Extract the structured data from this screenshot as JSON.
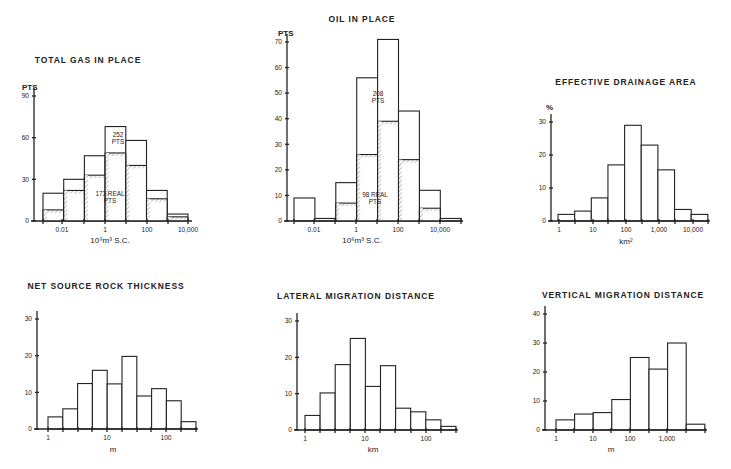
{
  "chart_data": [
    {
      "id": "gas",
      "type": "bar",
      "title": "TOTAL GAS IN PLACE",
      "ylabel": "PTS",
      "xlabel": "10⁹m³ S.C.",
      "yticks": [
        0,
        30,
        60,
        90
      ],
      "ylim": [
        0,
        90
      ],
      "xticks": [
        "0.01",
        "1",
        "100",
        "10,000"
      ],
      "x_scale": "log",
      "bin_edges_log10": [
        -3,
        -2.5,
        -1.5,
        -0.5,
        0.5,
        1.5,
        2.5,
        4
      ],
      "series": [
        {
          "name": "252 PTS (total)",
          "values": [
            20,
            30,
            47,
            68,
            58,
            22,
            5
          ]
        },
        {
          "name": "173 REAL PTS",
          "values": [
            8,
            22,
            33,
            49,
            40,
            16,
            3
          ],
          "style": "hatched"
        }
      ],
      "annotations": [
        {
          "text": [
            "252",
            "PTS"
          ]
        },
        {
          "text": [
            "173 REAL",
            "PTS"
          ]
        }
      ]
    },
    {
      "id": "oil",
      "type": "bar",
      "title": "OIL IN PLACE",
      "ylabel": "PTS",
      "xlabel": "10⁶m³ S.C.",
      "yticks": [
        0,
        10,
        20,
        30,
        40,
        50,
        60,
        70
      ],
      "ylim": [
        0,
        70
      ],
      "xticks": [
        "0.01",
        "1",
        "100",
        "10,000"
      ],
      "x_scale": "log",
      "series": [
        {
          "name": "208 PTS (total)",
          "values": [
            9,
            1,
            15,
            56,
            71,
            43,
            12,
            1
          ]
        },
        {
          "name": "98 REAL PTS",
          "values": [
            0,
            0,
            7,
            26,
            39,
            24,
            5,
            0
          ],
          "style": "hatched"
        }
      ],
      "annotations": [
        {
          "text": [
            "208",
            "PTS"
          ]
        },
        {
          "text": [
            "98 REAL",
            "PTS"
          ]
        }
      ]
    },
    {
      "id": "drainage",
      "type": "bar",
      "title": "EFFECTIVE DRAINAGE AREA",
      "ylabel": "%",
      "xlabel": "km²",
      "yticks": [
        0,
        10,
        20,
        30
      ],
      "ylim": [
        0,
        30
      ],
      "xticks": [
        "1",
        "10",
        "100",
        "1,000",
        "10,000"
      ],
      "x_scale": "log",
      "series": [
        {
          "name": "percent",
          "values": [
            2,
            3,
            7,
            17,
            29,
            23,
            15.5,
            3.5,
            2
          ]
        }
      ]
    },
    {
      "id": "thickness",
      "type": "bar",
      "title": "NET SOURCE ROCK THICKNESS",
      "ylabel": "",
      "xlabel": "m",
      "yticks": [
        0,
        10,
        20,
        30
      ],
      "ylim": [
        0,
        30
      ],
      "xticks": [
        "1",
        "10",
        "100"
      ],
      "x_scale": "log",
      "series": [
        {
          "name": "percent",
          "values": [
            3.3,
            5.5,
            12.4,
            16,
            12.3,
            19.8,
            9,
            11,
            7.7,
            2
          ]
        }
      ]
    },
    {
      "id": "lateral",
      "type": "bar",
      "title": "LATERAL MIGRATION DISTANCE",
      "ylabel": "",
      "xlabel": "km",
      "yticks": [
        0,
        10,
        20,
        30
      ],
      "ylim": [
        0,
        30
      ],
      "xticks": [
        "1",
        "10",
        "100"
      ],
      "x_scale": "log",
      "series": [
        {
          "name": "percent",
          "values": [
            4,
            10.2,
            18,
            25.2,
            12,
            17.7,
            6,
            5,
            2.8,
            1
          ]
        }
      ]
    },
    {
      "id": "vertical",
      "type": "bar",
      "title": "VERTICAL MIGRATION DISTANCE",
      "ylabel": "",
      "xlabel": "m",
      "yticks": [
        0,
        10,
        20,
        30,
        40
      ],
      "ylim": [
        0,
        40
      ],
      "xticks": [
        "1",
        "10",
        "100",
        "1,000"
      ],
      "x_scale": "log",
      "series": [
        {
          "name": "percent",
          "values": [
            3.5,
            5.5,
            6,
            10.5,
            25,
            21,
            30,
            2
          ]
        }
      ]
    }
  ],
  "layout": [
    {
      "id": "gas",
      "title_x": 88,
      "title_y": 63,
      "ylabel_x": 22,
      "ylabel_y": 90,
      "axis_x": 34,
      "y0": 221,
      "ytop": 96,
      "axis_end": 190,
      "bar_x0": 43,
      "bar_w": 20.7,
      "xtick_px": [
        62,
        105,
        147,
        188
      ],
      "minor_ticks": [
        43,
        84,
        126,
        168
      ],
      "xlabel_x": 110,
      "xlabel_y": 243,
      "ann_pos": [
        [
          118,
          137
        ],
        [
          110,
          196
        ]
      ]
    },
    {
      "id": "oil",
      "title_x": 362,
      "title_y": 22,
      "ylabel_x": 278,
      "ylabel_y": 36,
      "axis_x": 287,
      "y0": 221,
      "ytop": 42,
      "axis_end": 461,
      "bar_x0": 294,
      "bar_w": 20.9,
      "xtick_px": [
        314,
        356,
        398,
        440
      ],
      "minor_ticks": [
        294,
        335,
        377,
        419,
        461
      ],
      "xlabel_x": 362,
      "xlabel_y": 243,
      "ann_pos": [
        [
          378,
          96
        ],
        [
          375,
          197
        ]
      ]
    },
    {
      "id": "drainage",
      "title_x": 626,
      "title_y": 85,
      "ylabel_x": 546,
      "ylabel_y": 110,
      "axis_x": 551,
      "y0": 221,
      "ytop": 122,
      "axis_end": 708,
      "bar_x0": 558,
      "bar_w": 16.65,
      "xtick_px": [
        559,
        593,
        626,
        659,
        693
      ],
      "minor_ticks": [
        575,
        608,
        642,
        675,
        708
      ],
      "xlabel_x": 626,
      "xlabel_y": 244
    },
    {
      "id": "thickness",
      "title_x": 106,
      "title_y": 289,
      "ylabel_x": 0,
      "ylabel_y": 0,
      "axis_x": 37,
      "y0": 429,
      "ytop": 319,
      "axis_end": 196,
      "bar_x0": 48,
      "bar_w": 14.8,
      "xtick_px": [
        48,
        107,
        166
      ],
      "minor_ticks": [
        63,
        78,
        92,
        122,
        137,
        151,
        181,
        196
      ],
      "xlabel_x": 113,
      "xlabel_y": 452
    },
    {
      "id": "lateral",
      "title_x": 356,
      "title_y": 299,
      "ylabel_x": 0,
      "ylabel_y": 0,
      "axis_x": 297,
      "y0": 430,
      "ytop": 321,
      "axis_end": 456,
      "bar_x0": 305,
      "bar_w": 15.1,
      "xtick_px": [
        305,
        365,
        426
      ],
      "minor_ticks": [
        320,
        335,
        350,
        380,
        395,
        411,
        441,
        456
      ],
      "xlabel_x": 373,
      "xlabel_y": 452
    },
    {
      "id": "vertical",
      "title_x": 623,
      "title_y": 298,
      "ylabel_x": 0,
      "ylabel_y": 0,
      "axis_x": 545,
      "y0": 430,
      "ytop": 314,
      "axis_end": 705,
      "bar_x0": 556,
      "bar_w": 18.6,
      "xtick_px": [
        556,
        593,
        630,
        667
      ],
      "minor_ticks": [
        574,
        611,
        649,
        686,
        705
      ],
      "xlabel_x": 611,
      "xlabel_y": 452
    }
  ]
}
